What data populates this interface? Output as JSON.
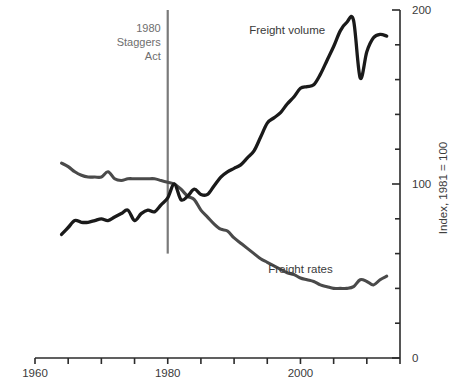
{
  "chart_data": {
    "type": "line",
    "title": "",
    "xlabel": "",
    "ylabel": "Index, 1981 = 100",
    "xlim": [
      1960,
      2015
    ],
    "ylim": [
      0,
      200
    ],
    "xticks": [
      1960,
      1965,
      1970,
      1975,
      1980,
      1985,
      1990,
      1995,
      2000,
      2005,
      2010,
      2015
    ],
    "xtick_labels": [
      "1960",
      "",
      "",
      "",
      "1980",
      "",
      "",
      "",
      "2000",
      "",
      "",
      ""
    ],
    "yticks": [
      0,
      20,
      40,
      60,
      80,
      100,
      120,
      140,
      160,
      180,
      200
    ],
    "ytick_labels": [
      "0",
      "",
      "",
      "",
      "",
      "100",
      "",
      "",
      "",
      "",
      "200"
    ],
    "grid": false,
    "legend": "inline-annotation",
    "annotations": [
      {
        "name": "staggers-act-marker",
        "text_lines": [
          "1980",
          "Staggers",
          "Act"
        ],
        "x": 1980,
        "y_top": 200,
        "y_bottom": 60,
        "color": "#7a7a7a"
      }
    ],
    "series": [
      {
        "name": "Freight volume",
        "color": "#1a1a1a",
        "label_x": 1998,
        "label_y": 186,
        "x": [
          1964,
          1965,
          1966,
          1967,
          1968,
          1969,
          1970,
          1971,
          1972,
          1973,
          1974,
          1975,
          1976,
          1977,
          1978,
          1979,
          1980,
          1981,
          1982,
          1983,
          1984,
          1985,
          1986,
          1987,
          1988,
          1989,
          1990,
          1991,
          1992,
          1993,
          1994,
          1995,
          1996,
          1997,
          1998,
          1999,
          2000,
          2001,
          2002,
          2003,
          2004,
          2005,
          2006,
          2007,
          2008,
          2009,
          2010,
          2011,
          2012,
          2013
        ],
        "y": [
          71,
          75,
          79,
          78,
          78,
          79,
          80,
          79,
          81,
          83,
          85,
          79,
          83,
          85,
          84,
          88,
          92,
          100,
          91,
          93,
          97,
          94,
          94,
          99,
          104,
          107,
          109,
          111,
          115,
          119,
          127,
          135,
          138,
          141,
          146,
          150,
          155,
          156,
          157,
          163,
          171,
          179,
          188,
          193,
          194,
          161,
          176,
          184,
          186,
          185
        ]
      },
      {
        "name": "Freight rates",
        "color": "#4a4a4a",
        "label_x": 2000,
        "label_y": 49,
        "x": [
          1964,
          1965,
          1966,
          1967,
          1968,
          1969,
          1970,
          1971,
          1972,
          1973,
          1974,
          1975,
          1976,
          1977,
          1978,
          1979,
          1980,
          1981,
          1982,
          1983,
          1984,
          1985,
          1986,
          1987,
          1988,
          1989,
          1990,
          1991,
          1992,
          1993,
          1994,
          1995,
          1996,
          1997,
          1998,
          1999,
          2000,
          2001,
          2002,
          2003,
          2004,
          2005,
          2006,
          2007,
          2008,
          2009,
          2010,
          2011,
          2012,
          2013
        ],
        "y": [
          112,
          110,
          107,
          105,
          104,
          104,
          104,
          107,
          103,
          102,
          103,
          103,
          103,
          103,
          103,
          102,
          101,
          100,
          97,
          93,
          91,
          85,
          81,
          77,
          74,
          73,
          69,
          66,
          63,
          60,
          57,
          55,
          53,
          51,
          49,
          48,
          46,
          45,
          44,
          42,
          41,
          40,
          40,
          40,
          41,
          45,
          44,
          42,
          45,
          47
        ]
      }
    ]
  },
  "axis": {
    "y_title": "Index, 1981 = 100",
    "y_labels": {
      "top": "200",
      "mid": "100",
      "bottom": "0"
    },
    "x_labels": {
      "start": "1960",
      "mid": "1980",
      "end": "2000"
    }
  },
  "labels": {
    "volume": "Freight volume",
    "rates": "Freight rates"
  },
  "annotation": {
    "line1": "1980",
    "line2": "Staggers",
    "line3": "Act"
  },
  "caption": {
    "text": ""
  },
  "colors": {
    "volume": "#1a1a1a",
    "rates": "#4a4a4a",
    "marker": "#7a7a7a",
    "axis": "#2b2b2b",
    "text": "#3a3a3a",
    "annotation_text": "#6e6e6e"
  }
}
